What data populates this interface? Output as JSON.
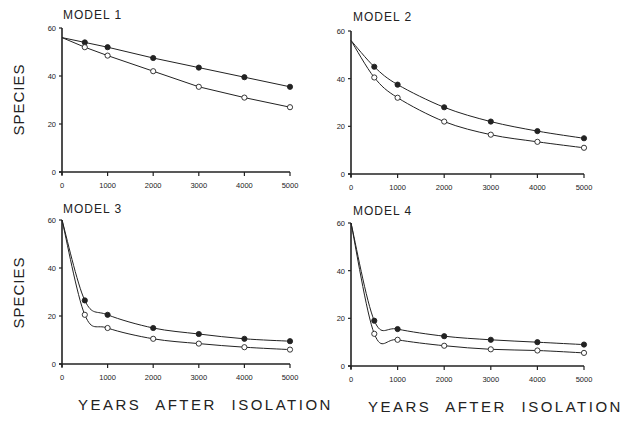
{
  "figure": {
    "ylabel": "SPECIES",
    "xlabel": "YEARS AFTER ISOLATION",
    "colors": {
      "line": "#222222",
      "background": "#ffffff"
    }
  },
  "chart_data": [
    {
      "type": "line",
      "title": "MODEL 1",
      "xlabel": "",
      "ylabel": "SPECIES",
      "x_ticks": [
        0,
        1000,
        2000,
        3000,
        4000,
        5000
      ],
      "y_ticks": [
        0,
        20,
        40,
        60
      ],
      "xlim": [
        0,
        5000
      ],
      "ylim": [
        0,
        60
      ],
      "grid": false,
      "legend": null,
      "x": [
        0,
        500,
        1000,
        2000,
        3000,
        4000,
        5000
      ],
      "series": [
        {
          "name": "filled circles",
          "marker": "filled",
          "values": [
            56,
            54,
            52,
            47.5,
            43.5,
            39.5,
            35.5
          ]
        },
        {
          "name": "open circles",
          "marker": "open",
          "values": [
            56,
            52,
            48.5,
            42,
            35.5,
            31,
            27
          ]
        }
      ]
    },
    {
      "type": "line",
      "title": "MODEL 2",
      "xlabel": "",
      "ylabel": "",
      "x_ticks": [
        0,
        1000,
        2000,
        3000,
        4000,
        5000
      ],
      "y_ticks": [
        0,
        20,
        40,
        60
      ],
      "xlim": [
        0,
        5000
      ],
      "ylim": [
        0,
        60
      ],
      "grid": false,
      "legend": null,
      "x": [
        0,
        500,
        1000,
        2000,
        3000,
        4000,
        5000
      ],
      "series": [
        {
          "name": "filled circles",
          "marker": "filled",
          "values": [
            56,
            45,
            37.5,
            28,
            22,
            18,
            15
          ]
        },
        {
          "name": "open circles",
          "marker": "open",
          "values": [
            56,
            40.5,
            32,
            22,
            16.5,
            13.5,
            11
          ]
        }
      ]
    },
    {
      "type": "line",
      "title": "MODEL 3",
      "xlabel": "YEARS AFTER ISOLATION",
      "ylabel": "SPECIES",
      "x_ticks": [
        0,
        1000,
        2000,
        3000,
        4000,
        5000
      ],
      "y_ticks": [
        0,
        20,
        40,
        60
      ],
      "xlim": [
        0,
        5000
      ],
      "ylim": [
        0,
        60
      ],
      "grid": false,
      "legend": null,
      "x": [
        0,
        500,
        1000,
        2000,
        3000,
        4000,
        5000
      ],
      "series": [
        {
          "name": "filled circles",
          "marker": "filled",
          "values": [
            60,
            26.5,
            20.5,
            15,
            12.5,
            10.5,
            9.5
          ]
        },
        {
          "name": "open circles",
          "marker": "open",
          "values": [
            60,
            20.5,
            15,
            10.5,
            8.5,
            7,
            6
          ]
        }
      ]
    },
    {
      "type": "line",
      "title": "MODEL 4",
      "xlabel": "YEARS AFTER ISOLATION",
      "ylabel": "",
      "x_ticks": [
        0,
        1000,
        2000,
        3000,
        4000,
        5000
      ],
      "y_ticks": [
        0,
        20,
        40,
        60
      ],
      "xlim": [
        0,
        5000
      ],
      "ylim": [
        0,
        60
      ],
      "grid": false,
      "legend": null,
      "x": [
        0,
        500,
        1000,
        2000,
        3000,
        4000,
        5000
      ],
      "series": [
        {
          "name": "filled circles",
          "marker": "filled",
          "values": [
            60,
            19,
            15.5,
            12.5,
            11,
            10,
            9
          ]
        },
        {
          "name": "open circles",
          "marker": "open",
          "values": [
            60,
            13.5,
            11,
            8.5,
            7,
            6.5,
            5.5
          ]
        }
      ]
    }
  ]
}
